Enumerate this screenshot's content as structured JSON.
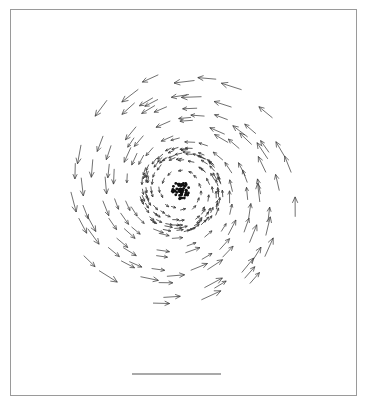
{
  "chart_data": {
    "type": "quiver",
    "title": "",
    "xlabel": "",
    "ylabel": "",
    "grid": false,
    "legend": null,
    "center": [
      181,
      190
    ],
    "core_radius": 9,
    "ring_radius": 38,
    "rotation": "counter-clockwise",
    "rings": [
      {
        "radius": 20,
        "count": 14,
        "length": 5
      },
      {
        "radius": 30,
        "count": 22,
        "length": 6
      },
      {
        "radius": 36,
        "count": 40,
        "length": 7
      },
      {
        "radius": 40,
        "count": 44,
        "length": 7
      },
      {
        "radius": 52,
        "count": 22,
        "length": 11
      },
      {
        "radius": 66,
        "count": 24,
        "length": 14
      },
      {
        "radius": 80,
        "count": 26,
        "length": 16
      },
      {
        "radius": 95,
        "count": 26,
        "length": 17
      },
      {
        "radius": 110,
        "count": 22,
        "length": 18
      }
    ],
    "scale_bar": {
      "x1": 132,
      "x2": 221,
      "y": 374,
      "label": ""
    },
    "colors": {
      "arrow": "#333333",
      "core": "#111111",
      "frame": "#9a9a9a",
      "scale_bar": "#555555"
    }
  }
}
